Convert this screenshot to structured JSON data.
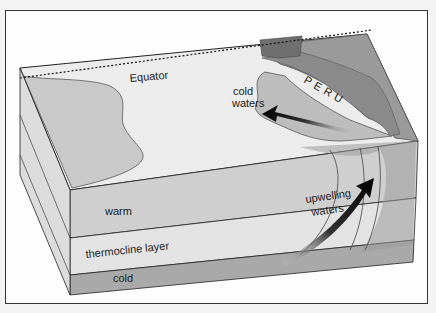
{
  "diagram": {
    "labels": {
      "equator": "Equator",
      "country": "PERU",
      "surface_pool": "cold\nwaters",
      "surface_pool_line1": "cold",
      "surface_pool_line2": "waters",
      "layer_warm": "warm",
      "layer_thermocline": "thermocline layer",
      "layer_cold": "cold",
      "upwelling_line1": "upwelling",
      "upwelling_line2": "waters"
    },
    "layers": [
      {
        "name": "warm",
        "color": "#cfcfcf"
      },
      {
        "name": "thermocline layer",
        "color": "#e3e3e3"
      },
      {
        "name": "cold",
        "color": "#a9a9a9"
      }
    ],
    "arrows": [
      {
        "name": "surface-current-arrow",
        "direction": "northwest, away from coast"
      },
      {
        "name": "upwelling-arrow",
        "direction": "upward toward surface"
      }
    ],
    "colors": {
      "ocean_surface": "#ececec",
      "warm_pool": "#c9c9c9",
      "cold_pool": "#bdbdbd",
      "land": "#9a9a9a",
      "peru": "#8a8a8a",
      "ecuador": "#6f6f6f",
      "arrow": "#111111"
    }
  }
}
